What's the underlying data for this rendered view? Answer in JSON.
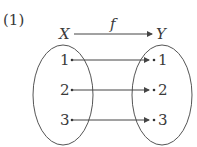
{
  "problem_number": "(1)",
  "function_label": "f",
  "domain": {
    "name": "X",
    "elements": [
      "1",
      "2",
      "3"
    ]
  },
  "codomain": {
    "name": "Y",
    "elements": [
      "1",
      "2",
      "3"
    ]
  },
  "mappings": [
    {
      "from": "1",
      "to": "1"
    },
    {
      "from": "2",
      "to": "2"
    },
    {
      "from": "3",
      "to": "3"
    }
  ]
}
